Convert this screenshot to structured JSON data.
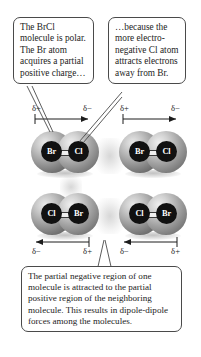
{
  "figure": {
    "background": "#ffffff"
  },
  "callouts": {
    "left": {
      "text": "The BrCl molecule is polar. The Br atom acquires a partial positive charge…",
      "points_to": "br-atom-top-left"
    },
    "right": {
      "text": "…because the more electro-negative Cl atom attracts electrons away from Br.",
      "points_to": "cl-atom-top-left"
    },
    "bottom": {
      "text": "The partial negative region of one molecule is attracted to the partial positive region of the neighboring molecule. This results in dipole-dipole forces among the molecules.",
      "points_to": "gap-between-bottom-molecules"
    }
  },
  "symbols": {
    "delta_plus": "δ+",
    "delta_minus": "δ−"
  },
  "dipoles": [
    {
      "id": "dipole-top-left",
      "position": "top-left",
      "direction": "right",
      "left_label": "δ+",
      "right_label": "δ−",
      "labels_above": true
    },
    {
      "id": "dipole-top-right",
      "position": "top-right",
      "direction": "right",
      "left_label": "δ+",
      "right_label": "δ−",
      "labels_above": true
    },
    {
      "id": "dipole-bottom-left",
      "position": "bottom-left",
      "direction": "left",
      "left_label": "δ−",
      "right_label": "δ+",
      "labels_above": false
    },
    {
      "id": "dipole-bottom-right",
      "position": "bottom-right",
      "direction": "left",
      "left_label": "δ−",
      "right_label": "δ+",
      "labels_above": false
    }
  ],
  "molecules": [
    {
      "id": "molecule-top-left",
      "left_atom": "Br",
      "right_atom": "Cl",
      "formula": "BrCl"
    },
    {
      "id": "molecule-top-right",
      "left_atom": "Br",
      "right_atom": "Cl",
      "formula": "BrCl"
    },
    {
      "id": "molecule-bottom-left",
      "left_atom": "Cl",
      "right_atom": "Br",
      "formula": "BrCl"
    },
    {
      "id": "molecule-bottom-right",
      "left_atom": "Cl",
      "right_atom": "Br",
      "formula": "BrCl"
    }
  ],
  "colors": {
    "callout_border": "#4a4a4a",
    "callout_fill": "#ffffff",
    "atom_label_fill": "#111111",
    "atom_label_text": "#ffffff",
    "text": "#1c1c1c",
    "sphere_light": "#e9e9e9",
    "sphere_dark": "#565656"
  }
}
